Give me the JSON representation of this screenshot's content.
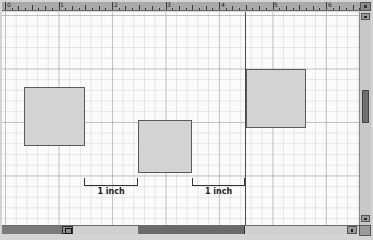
{
  "ruler": {
    "unit": "inch",
    "labels": [
      "0",
      "1",
      "2",
      "3",
      "4",
      "5",
      "6"
    ],
    "label_positions": [
      3,
      56,
      110,
      163,
      217,
      270,
      324
    ]
  },
  "canvas": {
    "background": "#fbfbfb",
    "grid_color": "#969696",
    "page_break_x": 245
  },
  "shapes": [
    {
      "id": "square-1",
      "x": 24,
      "y": 87,
      "w": 61,
      "h": 59,
      "fill": "#d3d3d3",
      "stroke": "#5a5a5a"
    },
    {
      "id": "square-2",
      "x": 138,
      "y": 120,
      "w": 54,
      "h": 53,
      "fill": "#d3d3d3",
      "stroke": "#5a5a5a"
    },
    {
      "id": "square-3",
      "x": 246,
      "y": 69,
      "w": 60,
      "h": 59,
      "fill": "#d3d3d3",
      "stroke": "#5a5a5a"
    }
  ],
  "dimensions": [
    {
      "label": "1 inch",
      "x1": 84,
      "x2": 138,
      "y": 178
    },
    {
      "label": "1 inch",
      "x1": 192,
      "x2": 245,
      "y": 178
    }
  ],
  "scrollbars": {
    "vertical": {
      "thumb_top": 90,
      "thumb_height": 33
    },
    "horizontal": {
      "thumb_left": 138,
      "thumb_width": 107
    }
  }
}
